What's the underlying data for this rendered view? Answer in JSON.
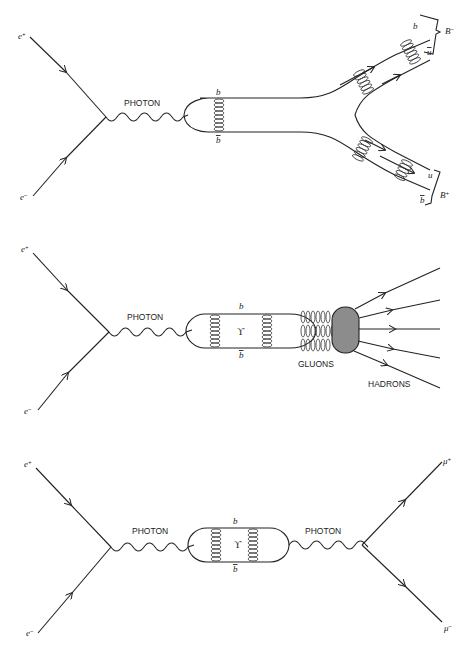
{
  "diagrams": [
    {
      "id": "b-meson-production",
      "incoming": [
        {
          "particle": "e",
          "charge": "+"
        },
        {
          "particle": "e",
          "charge": "-"
        }
      ],
      "mediator_label": "PHOTON",
      "quark_top": "b",
      "quark_bottom": "b̄",
      "outgoing": [
        {
          "quarks": [
            "b",
            "ū"
          ],
          "meson": "B",
          "charge": "-"
        },
        {
          "quarks": [
            "u",
            "b̄"
          ],
          "meson": "B",
          "charge": "+"
        }
      ]
    },
    {
      "id": "upsilon-to-hadrons",
      "incoming": [
        {
          "particle": "e",
          "charge": "+"
        },
        {
          "particle": "e",
          "charge": "-"
        }
      ],
      "mediator_label": "PHOTON",
      "quark_top": "b",
      "quark_bottom": "b̄",
      "bound_state": "ϒ",
      "gluons_label": "GLUONS",
      "hadrons_label": "HADRONS"
    },
    {
      "id": "upsilon-to-muons",
      "incoming": [
        {
          "particle": "e",
          "charge": "+"
        },
        {
          "particle": "e",
          "charge": "-"
        }
      ],
      "mediator_label_left": "PHOTON",
      "mediator_label_right": "PHOTON",
      "quark_top": "b",
      "quark_bottom": "b̄",
      "bound_state": "ϒ",
      "outgoing": [
        {
          "particle": "μ",
          "charge": "+"
        },
        {
          "particle": "μ",
          "charge": "-"
        }
      ]
    }
  ],
  "labels": {
    "e": "e",
    "plus": "+",
    "minus": "−",
    "photon": "PHOTON",
    "gluons": "GLUONS",
    "hadrons": "HADRONS",
    "b": "b",
    "bbar": "b",
    "ubar": "u",
    "u": "u",
    "B": "B",
    "upsilon": "ϒ",
    "mu": "μ"
  }
}
